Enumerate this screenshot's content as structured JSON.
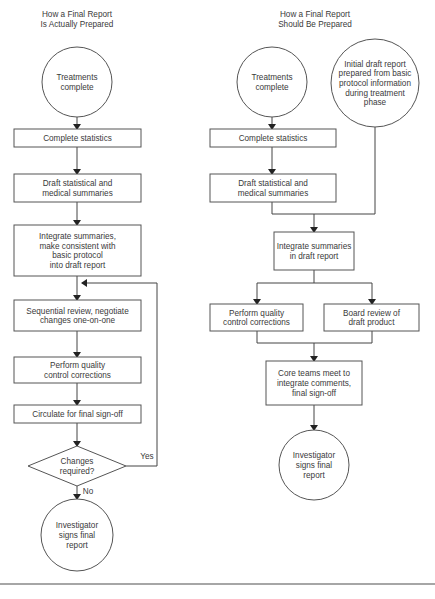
{
  "left_flow": {
    "title": [
      "How a Final Report",
      "Is Actually Prepared"
    ],
    "nodes": [
      {
        "id": "L1",
        "type": "circle",
        "cx": 77,
        "cy": 82,
        "r": 35,
        "lines": [
          "Treatments",
          "complete"
        ]
      },
      {
        "id": "L2",
        "type": "box",
        "x": 14,
        "y": 129,
        "w": 127,
        "h": 18,
        "lines": [
          "Complete statistics"
        ]
      },
      {
        "id": "L3",
        "type": "box",
        "x": 14,
        "y": 174,
        "w": 127,
        "h": 28,
        "lines": [
          "Draft statistical and",
          "medical summaries"
        ]
      },
      {
        "id": "L4",
        "type": "box",
        "x": 14,
        "y": 225,
        "w": 127,
        "h": 51,
        "lines": [
          "Integrate summaries,",
          "make consistent with",
          "basic protocol",
          "into draft report"
        ]
      },
      {
        "id": "L5",
        "type": "box",
        "x": 14,
        "y": 300,
        "w": 127,
        "h": 31,
        "lines": [
          "Sequential review, negotiate",
          "changes one-on-one"
        ]
      },
      {
        "id": "L6",
        "type": "box",
        "x": 14,
        "y": 357,
        "w": 127,
        "h": 26,
        "lines": [
          "Perform quality",
          "control corrections"
        ]
      },
      {
        "id": "L7",
        "type": "box",
        "x": 14,
        "y": 405,
        "w": 127,
        "h": 18,
        "lines": [
          "Circulate for final sign-off"
        ]
      },
      {
        "id": "L8",
        "type": "diamond",
        "cx": 77,
        "cy": 466,
        "hw": 49,
        "hh": 20,
        "lines": [
          "Changes",
          "required?"
        ]
      },
      {
        "id": "L9",
        "type": "circle",
        "cx": 77,
        "cy": 535,
        "r": 36,
        "lines": [
          "Investigator",
          "signs final",
          "report"
        ]
      }
    ],
    "edges": [
      {
        "points": [
          [
            77,
            117
          ],
          [
            77,
            129
          ]
        ]
      },
      {
        "points": [
          [
            77,
            147
          ],
          [
            77,
            174
          ]
        ]
      },
      {
        "points": [
          [
            77,
            202
          ],
          [
            77,
            225
          ]
        ]
      },
      {
        "points": [
          [
            77,
            276
          ],
          [
            77,
            300
          ]
        ]
      },
      {
        "points": [
          [
            77,
            331
          ],
          [
            77,
            357
          ]
        ]
      },
      {
        "points": [
          [
            77,
            383
          ],
          [
            77,
            405
          ]
        ]
      },
      {
        "points": [
          [
            77,
            423
          ],
          [
            77,
            446
          ]
        ]
      },
      {
        "points": [
          [
            77,
            486
          ],
          [
            77,
            499
          ]
        ]
      },
      {
        "points": [
          [
            126,
            466
          ],
          [
            157,
            466
          ],
          [
            157,
            283
          ],
          [
            82,
            283
          ]
        ]
      }
    ],
    "edge_labels": [
      {
        "text": "Yes",
        "x": 147,
        "y": 459
      },
      {
        "text": "No",
        "x": 88,
        "y": 494
      }
    ]
  },
  "right_flow": {
    "title": [
      "How a Final Report",
      "Should Be Prepared"
    ],
    "nodes": [
      {
        "id": "R1",
        "type": "circle",
        "cx": 272,
        "cy": 82,
        "r": 35,
        "lines": [
          "Treatments",
          "complete"
        ]
      },
      {
        "id": "R2",
        "type": "circle",
        "cx": 375,
        "cy": 83,
        "r": 44,
        "lines": [
          "Initial draft report",
          "prepared from basic",
          "protocol information",
          "during treatment",
          "phase"
        ]
      },
      {
        "id": "R3",
        "type": "box",
        "x": 210,
        "y": 129,
        "w": 126,
        "h": 18,
        "lines": [
          "Complete statistics"
        ]
      },
      {
        "id": "R4",
        "type": "box",
        "x": 210,
        "y": 174,
        "w": 126,
        "h": 28,
        "lines": [
          "Draft statistical and",
          "medical summaries"
        ]
      },
      {
        "id": "R5",
        "type": "box",
        "x": 274,
        "y": 232,
        "w": 80,
        "h": 38,
        "lines": [
          "Integrate summaries",
          "in draft report"
        ]
      },
      {
        "id": "R6",
        "type": "box",
        "x": 210,
        "y": 304,
        "w": 93,
        "h": 27,
        "lines": [
          "Perform quality",
          "control corrections"
        ]
      },
      {
        "id": "R7",
        "type": "box",
        "x": 324,
        "y": 304,
        "w": 95,
        "h": 27,
        "lines": [
          "Board review of",
          "draft product"
        ]
      },
      {
        "id": "R8",
        "type": "box",
        "x": 266,
        "y": 361,
        "w": 96,
        "h": 44,
        "lines": [
          "Core teams meet to",
          "integrate comments,",
          "final sign-off"
        ]
      },
      {
        "id": "R9",
        "type": "circle",
        "cx": 314,
        "cy": 465,
        "r": 35,
        "lines": [
          "Investigator",
          "signs final",
          "report"
        ]
      }
    ],
    "edges": [
      {
        "points": [
          [
            272,
            117
          ],
          [
            272,
            129
          ]
        ]
      },
      {
        "points": [
          [
            272,
            147
          ],
          [
            272,
            174
          ]
        ]
      },
      {
        "points": [
          [
            272,
            202
          ],
          [
            272,
            214
          ],
          [
            375,
            214
          ],
          [
            375,
            127
          ]
        ],
        "arrow": false
      },
      {
        "points": [
          [
            314,
            214
          ],
          [
            314,
            232
          ]
        ]
      },
      {
        "points": [
          [
            314,
            270
          ],
          [
            314,
            283
          ],
          [
            257,
            283
          ],
          [
            257,
            304
          ]
        ]
      },
      {
        "points": [
          [
            314,
            283
          ],
          [
            372,
            283
          ],
          [
            372,
            304
          ]
        ]
      },
      {
        "points": [
          [
            257,
            331
          ],
          [
            257,
            343
          ],
          [
            372,
            343
          ],
          [
            372,
            331
          ]
        ],
        "arrow": false
      },
      {
        "points": [
          [
            314,
            343
          ],
          [
            314,
            361
          ]
        ]
      },
      {
        "points": [
          [
            314,
            405
          ],
          [
            314,
            430
          ]
        ]
      }
    ],
    "edge_labels": []
  },
  "colors": {
    "stroke": "#555555",
    "text": "#3a3a3a",
    "background": "#ffffff",
    "rule": "#888888"
  },
  "footer_rule_y": 584
}
